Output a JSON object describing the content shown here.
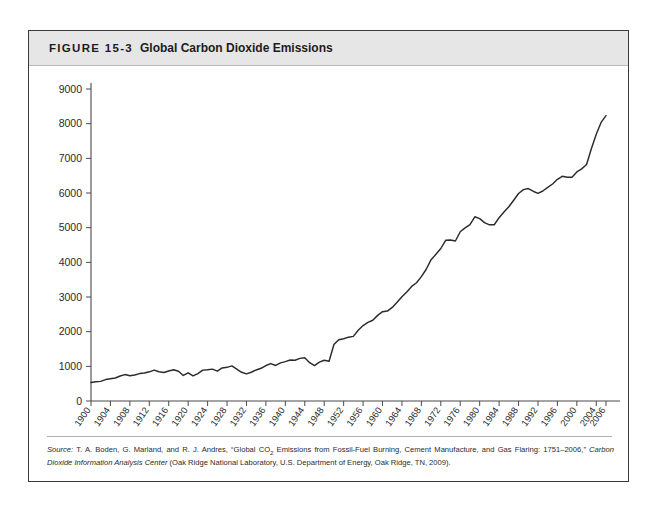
{
  "figure": {
    "number": "FIGURE 15-3",
    "title": "Global Carbon Dioxide Emissions"
  },
  "source": {
    "label": "Source:",
    "text_part1": " T. A. Boden, G. Marland, and R. J. Andres, “Global CO",
    "subscript": "2",
    "text_part2": " Emissions from Fossil-Fuel Burning, Cement Manufacture, and Gas Flaring: 1751–2006,” ",
    "italic_title": "Carbon Dioxide Information Analysis Center",
    "text_part3": " (Oak Ridge National Laboratory, U.S. Department of Energy, Oak Ridge, TN, 2009)."
  },
  "chart_data": {
    "type": "line",
    "title": "Global Carbon Dioxide Emissions",
    "xlabel": "",
    "ylabel": "",
    "xlim": [
      1900,
      2006
    ],
    "ylim": [
      0,
      9000
    ],
    "ytick_values": [
      0,
      1000,
      2000,
      3000,
      4000,
      5000,
      6000,
      7000,
      8000,
      9000
    ],
    "ytick_labels": [
      "0",
      "1000",
      "2000",
      "3000",
      "4000",
      "5000",
      "6000",
      "7000",
      "8000",
      "9000"
    ],
    "xtick_values": [
      1900,
      1904,
      1908,
      1912,
      1916,
      1920,
      1924,
      1928,
      1932,
      1936,
      1940,
      1944,
      1948,
      1952,
      1956,
      1960,
      1964,
      1968,
      1972,
      1976,
      1980,
      1984,
      1988,
      1992,
      1996,
      2000,
      2004,
      2006
    ],
    "xtick_labels": [
      "1900",
      "1904",
      "1908",
      "1912",
      "1916",
      "1920",
      "1924",
      "1928",
      "1932",
      "1936",
      "1940",
      "1944",
      "1948",
      "1952",
      "1956",
      "1960",
      "1964",
      "1968",
      "1972",
      "1976",
      "1980",
      "1984",
      "1988",
      "1992",
      "1996",
      "2000",
      "2004",
      "2006"
    ],
    "grid": false,
    "legend": "none",
    "units": "million metric tons of carbon",
    "line_color": "#2b2b2b",
    "series": [
      {
        "name": "Global CO2 emissions",
        "x": [
          1900,
          1901,
          1902,
          1903,
          1904,
          1905,
          1906,
          1907,
          1908,
          1909,
          1910,
          1911,
          1912,
          1913,
          1914,
          1915,
          1916,
          1917,
          1918,
          1919,
          1920,
          1921,
          1922,
          1923,
          1924,
          1925,
          1926,
          1927,
          1928,
          1929,
          1930,
          1931,
          1932,
          1933,
          1934,
          1935,
          1936,
          1937,
          1938,
          1939,
          1940,
          1941,
          1942,
          1943,
          1944,
          1945,
          1946,
          1947,
          1948,
          1949,
          1950,
          1951,
          1952,
          1953,
          1954,
          1955,
          1956,
          1957,
          1958,
          1959,
          1960,
          1961,
          1962,
          1963,
          1964,
          1965,
          1966,
          1967,
          1968,
          1969,
          1970,
          1971,
          1972,
          1973,
          1974,
          1975,
          1976,
          1977,
          1978,
          1979,
          1980,
          1981,
          1982,
          1983,
          1984,
          1985,
          1986,
          1987,
          1988,
          1989,
          1990,
          1991,
          1992,
          1993,
          1994,
          1995,
          1996,
          1997,
          1998,
          1999,
          2000,
          2001,
          2002,
          2003,
          2004,
          2005,
          2006
        ],
        "values": [
          534,
          556,
          566,
          618,
          640,
          664,
          720,
          762,
          730,
          749,
          791,
          807,
          842,
          892,
          844,
          823,
          866,
          902,
          860,
          737,
          813,
          723,
          792,
          891,
          903,
          920,
          863,
          954,
          971,
          1012,
          921,
          828,
          783,
          830,
          896,
          943,
          1023,
          1079,
          1025,
          1099,
          1135,
          1181,
          1176,
          1230,
          1246,
          1106,
          1021,
          1121,
          1174,
          1147,
          1630,
          1768,
          1796,
          1841,
          1865,
          2043,
          2177,
          2270,
          2330,
          2470,
          2577,
          2594,
          2700,
          2848,
          3008,
          3145,
          3305,
          3411,
          3588,
          3800,
          4076,
          4231,
          4399,
          4635,
          4644,
          4615,
          4883,
          4995,
          5090,
          5314,
          5262,
          5144,
          5083,
          5085,
          5288,
          5452,
          5604,
          5792,
          5984,
          6097,
          6129,
          6051,
          5991,
          6058,
          6161,
          6259,
          6395,
          6481,
          6455,
          6457,
          6609,
          6696,
          6820,
          7282,
          7695,
          8038,
          8230
        ]
      }
    ]
  }
}
